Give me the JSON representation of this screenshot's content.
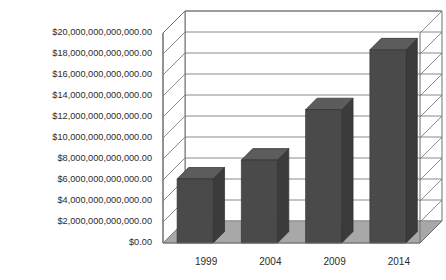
{
  "chart_data": {
    "type": "bar",
    "title": "",
    "subtitle": "",
    "xlabel": "",
    "ylabel": "",
    "categories": [
      "1999",
      "2004",
      "2009",
      "2014"
    ],
    "values": [
      6100000000000,
      7900000000000,
      12700000000000,
      18400000000000
    ],
    "series": [
      {
        "name": "",
        "values": [
          6100000000000,
          7900000000000,
          12700000000000,
          18400000000000
        ]
      }
    ],
    "ylim": [
      0,
      20000000000000
    ],
    "ytick_step": 2000000000000,
    "ytick_labels": [
      "$20,000,000,000,000.00",
      "$18,000,000,000,000.00",
      "$16,000,000,000,000.00",
      "$14,000,000,000,000.00",
      "$12,000,000,000,000.00",
      "$10,000,000,000,000.00",
      "$8,000,000,000,000.00",
      "$6,000,000,000,000.00",
      "$4,000,000,000,000.00",
      "$2,000,000,000,000.00",
      "$0.00"
    ],
    "ytick_values": [
      20000000000000,
      18000000000000,
      16000000000000,
      14000000000000,
      12000000000000,
      10000000000000,
      8000000000000,
      6000000000000,
      4000000000000,
      2000000000000,
      0
    ],
    "xtick_labels": [
      "1999",
      "2004",
      "2009",
      "2014"
    ],
    "grid": true,
    "legend": false,
    "legend_position": "none",
    "three_d": true,
    "annotations": []
  },
  "style": {
    "bar_front_color": "#4a4a4a",
    "bar_side_color": "#3b3b3b",
    "bar_top_color": "#5c5c5c",
    "floor_color": "#a8a8a8",
    "floor_edge_color": "#8f8f8f",
    "wall_color": "#ffffff",
    "grid_line_color": "#7d7d7d",
    "frame_line_color": "#6e6e6e",
    "axis_text_color": "#2b2b2b",
    "background_color": "#ffffff"
  }
}
